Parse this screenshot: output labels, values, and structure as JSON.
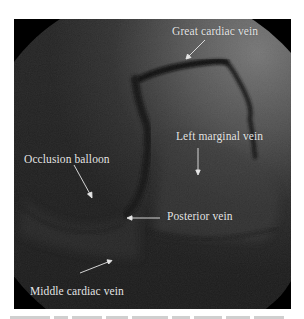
{
  "figure": {
    "type": "coronary venous angiogram (fluoroscopy)",
    "colors": {
      "background_dark": "#262626",
      "background_light": "#707070",
      "vein_contrast": "#141414",
      "label_text": "#e6e6e6",
      "page_background": "#ffffff"
    },
    "labels": [
      {
        "id": "great-cardiac-vein",
        "text": "Great cardiac vein"
      },
      {
        "id": "left-marginal-vein",
        "text": "Left marginal vein"
      },
      {
        "id": "occlusion-balloon",
        "text": "Occlusion balloon"
      },
      {
        "id": "posterior-vein",
        "text": "Posterior vein"
      },
      {
        "id": "middle-cardiac-vein",
        "text": "Middle cardiac vein"
      }
    ]
  }
}
